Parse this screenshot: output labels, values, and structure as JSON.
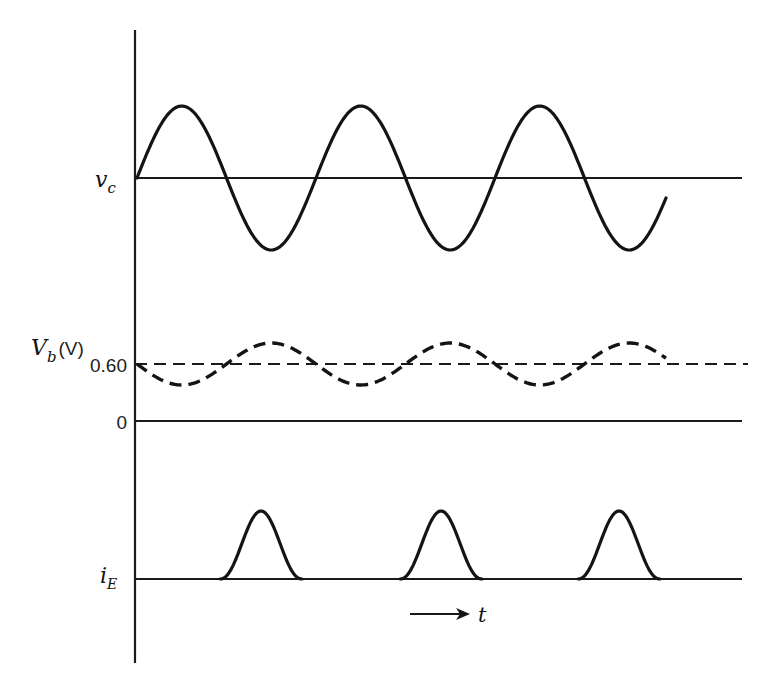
{
  "figure": {
    "type": "waveform-timing-diagram",
    "colors": {
      "ink": "#141414",
      "background": "#ffffff"
    }
  },
  "labels": {
    "vc": {
      "main": "v",
      "sub": "c"
    },
    "vb": {
      "main": "V",
      "sub": "b",
      "unit": "(V)"
    },
    "vb_level": "0.60",
    "zero": "0",
    "ie": {
      "main": "i",
      "sub": "E"
    },
    "time": "t"
  },
  "chart_data": {
    "type": "line",
    "title": "",
    "xlabel": "t",
    "series": [
      {
        "name": "v_c",
        "style": "solid",
        "shape": "sinusoid",
        "baseline_label": "v_c",
        "cycles": 3,
        "phase": "starts at baseline going up, ends at baseline after 3 full cycles",
        "peaks_x_px": [
          178,
          357,
          536
        ],
        "troughs_x_px": [
          262,
          441,
          620
        ],
        "amplitude_px": 72
      },
      {
        "name": "V_b (V)",
        "style": "dashed",
        "shape": "sinusoid (inverted vs v_c, small amplitude)",
        "dc_level_V": 0.6,
        "cycles": 3,
        "peaks_x_px": [
          263,
          441,
          620
        ],
        "troughs_x_px": [
          178,
          357,
          536
        ],
        "amplitude_px": 21
      },
      {
        "name": "i_E",
        "style": "solid",
        "shape": "pulses",
        "pulse_count": 3,
        "pulse_peaks_x_px": [
          261,
          441,
          619
        ],
        "pulse_width_px": 82,
        "note": "current pulses coincide with V_b maxima / v_c minima"
      }
    ],
    "y_ticks": [
      "0.60",
      "0"
    ],
    "grid": false,
    "legend": "none"
  },
  "geometry": {
    "axis_x": 135,
    "axis_top": 30,
    "axis_bottom": 663,
    "line_right": 742,
    "vc_base_y": 178,
    "vc_amp": 72,
    "vb_base_y": 364,
    "vb_amp": 21,
    "zero_y": 421,
    "ie_base_y": 579,
    "ie_peak_h": 68,
    "wave_x0": 137,
    "period": 179,
    "wave_x_end": 666,
    "pulse_centers": [
      261,
      441,
      619
    ],
    "pulse_half_width": 41,
    "arrow": {
      "x1": 410,
      "x2": 470,
      "y": 614
    }
  }
}
